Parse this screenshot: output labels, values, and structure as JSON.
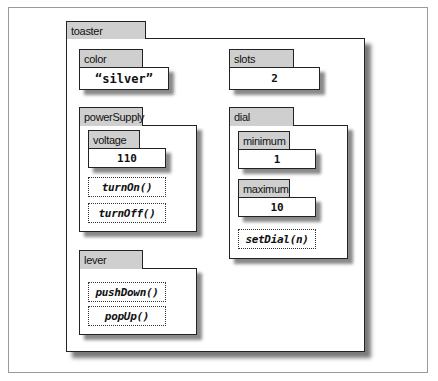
{
  "diagram": {
    "root": {
      "name": "toaster",
      "properties": [
        {
          "name": "color",
          "value": "“silver”"
        },
        {
          "name": "slots",
          "value": "2"
        }
      ],
      "objects": {
        "powerSupply": {
          "name": "powerSupply",
          "properties": [
            {
              "name": "voltage",
              "value": "110"
            }
          ],
          "methods": [
            "turnOn()",
            "turnOff()"
          ]
        },
        "lever": {
          "name": "lever",
          "methods": [
            "pushDown()",
            "popUp()"
          ]
        },
        "dial": {
          "name": "dial",
          "properties": [
            {
              "name": "minimum",
              "value": "1"
            },
            {
              "name": "maximum",
              "value": "10"
            }
          ],
          "methods": [
            "setDial(n)"
          ]
        }
      }
    }
  }
}
